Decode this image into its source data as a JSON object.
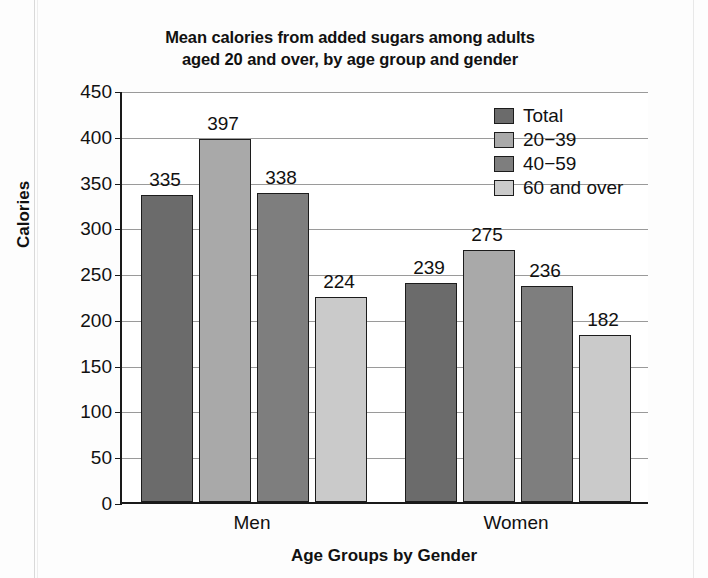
{
  "chart_data": {
    "type": "bar",
    "title": "Mean calories from added sugars among adults aged 20 and over, by age group and gender",
    "title_line1": "Mean calories from added sugars among adults",
    "title_line2": "aged 20 and over, by age group and gender",
    "xlabel": "Age Groups by Gender",
    "ylabel": "Calories",
    "categories": [
      "Men",
      "Women"
    ],
    "ylim": [
      0,
      450
    ],
    "ytick_step": 50,
    "yticks": [
      450,
      400,
      350,
      300,
      250,
      200,
      150,
      100,
      50,
      0
    ],
    "ytick_labels": [
      "450",
      "400",
      "350",
      "300",
      "250",
      "200",
      "150",
      "100",
      "50",
      "0"
    ],
    "grid": "horizontal",
    "legend_position": "top-right",
    "series": [
      {
        "name": "Total",
        "color": "#6b6b6b",
        "values": [
          335,
          239
        ]
      },
      {
        "name": "20−39",
        "color": "#a9a9a9",
        "values": [
          397,
          275
        ]
      },
      {
        "name": "40−59",
        "color": "#7e7e7e",
        "values": [
          338,
          236
        ]
      },
      {
        "name": "60 and over",
        "color": "#cacaca",
        "values": [
          224,
          182
        ]
      }
    ],
    "bar_labels": {
      "Men": [
        "335",
        "397",
        "338",
        "224"
      ],
      "Women": [
        "239",
        "275",
        "236",
        "182"
      ]
    }
  },
  "legend": {
    "items": [
      {
        "label": "Total",
        "color": "#6b6b6b"
      },
      {
        "label": "20−39",
        "color": "#a9a9a9"
      },
      {
        "label": "40−59",
        "color": "#7e7e7e"
      },
      {
        "label": "60 and over",
        "color": "#cacaca"
      }
    ]
  }
}
